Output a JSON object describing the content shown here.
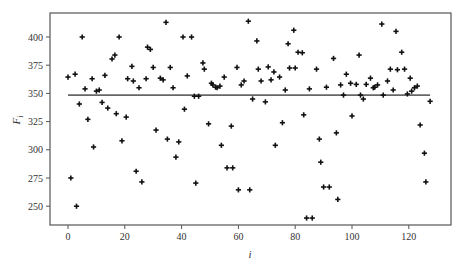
{
  "chart_data": {
    "type": "scatter",
    "title": "",
    "xlabel": "i",
    "ylabel": "F_i",
    "xlim": [
      -7,
      134
    ],
    "ylim": [
      233,
      425
    ],
    "xticks": [
      0,
      20,
      40,
      60,
      80,
      100,
      120
    ],
    "yticks": [
      250,
      275,
      300,
      325,
      350,
      375,
      400
    ],
    "grid": false,
    "legend": null,
    "marker": "plus",
    "marker_color": "#111111",
    "line_color": "#666666",
    "series": [
      {
        "name": "F_i",
        "type": "scatter",
        "points": [
          [
            0,
            364.5
          ],
          [
            1,
            275
          ],
          [
            2.5,
            367
          ],
          [
            3,
            250
          ],
          [
            4,
            340.6
          ],
          [
            5,
            400
          ],
          [
            6,
            354
          ],
          [
            7,
            327
          ],
          [
            8.5,
            363
          ],
          [
            9,
            302.5
          ],
          [
            10,
            352
          ],
          [
            11,
            353
          ],
          [
            12,
            342
          ],
          [
            13,
            366
          ],
          [
            14,
            337
          ],
          [
            15.5,
            380.5
          ],
          [
            16.5,
            384
          ],
          [
            17,
            332
          ],
          [
            18,
            400
          ],
          [
            19,
            308
          ],
          [
            20.5,
            329
          ],
          [
            21,
            363
          ],
          [
            22.5,
            374
          ],
          [
            23,
            361
          ],
          [
            24,
            281
          ],
          [
            25,
            355
          ],
          [
            26,
            271.5
          ],
          [
            27.5,
            363
          ],
          [
            28,
            391
          ],
          [
            29,
            389
          ],
          [
            30,
            373
          ],
          [
            31,
            317.5
          ],
          [
            32.5,
            363.5
          ],
          [
            33.5,
            362
          ],
          [
            34.5,
            413
          ],
          [
            35,
            309.5
          ],
          [
            36,
            373
          ],
          [
            37,
            355
          ],
          [
            38,
            293.5
          ],
          [
            39,
            307
          ],
          [
            40.5,
            400
          ],
          [
            41,
            336
          ],
          [
            42,
            365.5
          ],
          [
            43.5,
            400
          ],
          [
            44.5,
            347.5
          ],
          [
            45,
            270.5
          ],
          [
            46,
            347.5
          ],
          [
            47.5,
            377
          ],
          [
            48,
            371.5
          ],
          [
            49.5,
            323
          ],
          [
            50.5,
            359
          ],
          [
            51,
            357.5
          ],
          [
            52,
            355.5
          ],
          [
            52.5,
            355
          ],
          [
            53.5,
            356.5
          ],
          [
            54,
            304
          ],
          [
            55,
            364.5
          ],
          [
            56,
            284
          ],
          [
            57.5,
            321
          ],
          [
            58,
            284
          ],
          [
            59.5,
            373
          ],
          [
            60,
            264.5
          ],
          [
            61,
            357.5
          ],
          [
            62,
            361
          ],
          [
            63.5,
            414
          ],
          [
            64,
            264.5
          ],
          [
            65,
            345
          ],
          [
            66.5,
            396.5
          ],
          [
            67,
            371.5
          ],
          [
            68,
            361
          ],
          [
            69.5,
            342.5
          ],
          [
            70.5,
            373.5
          ],
          [
            71.5,
            362
          ],
          [
            72.5,
            369
          ],
          [
            73,
            304
          ],
          [
            74.5,
            364.5
          ],
          [
            75.5,
            324
          ],
          [
            76.5,
            353
          ],
          [
            77.5,
            394
          ],
          [
            78,
            372.5
          ],
          [
            79.5,
            406
          ],
          [
            80,
            372.5
          ],
          [
            81,
            386.5
          ],
          [
            82.5,
            386
          ],
          [
            83,
            331
          ],
          [
            84,
            239.5
          ],
          [
            85,
            354
          ],
          [
            86,
            239.5
          ],
          [
            87.5,
            371.5
          ],
          [
            88.5,
            309.5
          ],
          [
            89,
            289
          ],
          [
            90,
            267
          ],
          [
            91,
            355.5
          ],
          [
            92,
            267
          ],
          [
            93.5,
            381
          ],
          [
            94.5,
            315
          ],
          [
            95,
            256
          ],
          [
            96,
            357.5
          ],
          [
            97,
            348.5
          ],
          [
            98,
            367
          ],
          [
            99.5,
            359
          ],
          [
            100,
            330
          ],
          [
            101.5,
            358
          ],
          [
            102.5,
            384
          ],
          [
            103,
            348.5
          ],
          [
            104,
            345
          ],
          [
            105,
            358
          ],
          [
            106.5,
            363.5
          ],
          [
            107.5,
            355
          ],
          [
            108,
            355.5
          ],
          [
            109,
            357.5
          ],
          [
            110.5,
            411.5
          ],
          [
            111,
            348.5
          ],
          [
            112.5,
            361
          ],
          [
            113.5,
            371.5
          ],
          [
            114.5,
            353
          ],
          [
            115.5,
            405
          ],
          [
            116,
            371
          ],
          [
            117.5,
            386.5
          ],
          [
            118.5,
            371.5
          ],
          [
            119.5,
            349.5
          ],
          [
            120.5,
            363.5
          ],
          [
            121,
            352
          ],
          [
            122,
            355
          ],
          [
            123,
            356.5
          ],
          [
            124,
            322
          ],
          [
            125.5,
            297
          ],
          [
            126,
            271.5
          ],
          [
            127.5,
            343
          ]
        ]
      },
      {
        "name": "mean",
        "type": "line",
        "x": [
          0,
          127.5
        ],
        "y": [
          348.5,
          348.5
        ]
      }
    ]
  },
  "axes": {
    "xlabel": "i",
    "ylabel_main": "F",
    "ylabel_sub": "i"
  }
}
